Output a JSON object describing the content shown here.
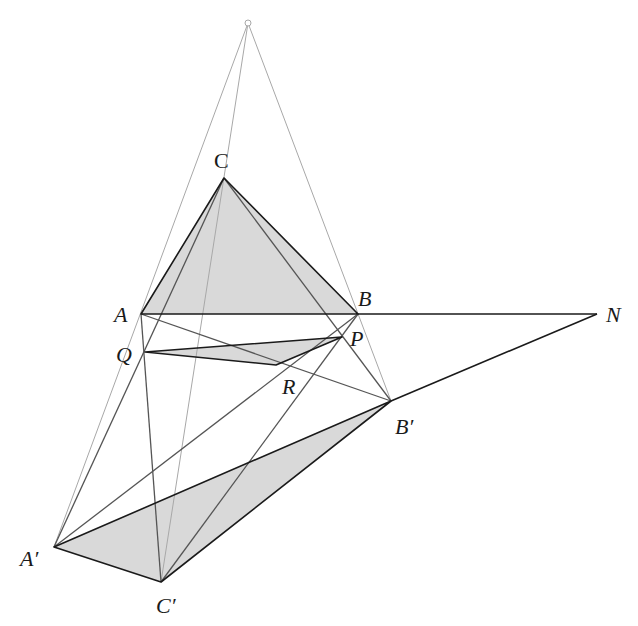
{
  "figure": {
    "fill_color": "#d9d9d9",
    "dark_stroke": "#1a1a1a",
    "medium_stroke": "#555555",
    "light_stroke": "#a8a8a8"
  },
  "points": {
    "O": {
      "x": 248,
      "y": 23,
      "label": ""
    },
    "A": {
      "x": 141,
      "y": 314,
      "label": "A"
    },
    "B": {
      "x": 358,
      "y": 314,
      "label": "B"
    },
    "C": {
      "x": 224,
      "y": 178,
      "label": "C"
    },
    "A1": {
      "x": 54,
      "y": 547,
      "label": "A′"
    },
    "B1": {
      "x": 391,
      "y": 401,
      "label": "B′"
    },
    "C1": {
      "x": 161,
      "y": 582,
      "label": "C′"
    },
    "P": {
      "x": 342,
      "y": 337,
      "label": "P"
    },
    "Q": {
      "x": 145,
      "y": 352,
      "label": "Q"
    },
    "R": {
      "x": 276,
      "y": 365,
      "label": "R"
    },
    "N": {
      "x": 597,
      "y": 314,
      "label": "N"
    }
  },
  "labels": {
    "A": {
      "text": "A",
      "x": 114,
      "y": 322
    },
    "B": {
      "text": "B",
      "x": 358,
      "y": 306
    },
    "C": {
      "text": "C",
      "x": 214,
      "y": 168,
      "upright": true
    },
    "A1": {
      "text": "A′",
      "x": 20,
      "y": 566
    },
    "B1": {
      "text": "B′",
      "x": 395,
      "y": 434
    },
    "C1": {
      "text": "C′",
      "x": 156,
      "y": 613
    },
    "P": {
      "text": "P",
      "x": 350,
      "y": 346
    },
    "Q": {
      "text": "Q",
      "x": 116,
      "y": 362
    },
    "R": {
      "text": "R",
      "x": 282,
      "y": 394
    },
    "N": {
      "text": "N",
      "x": 606,
      "y": 322
    }
  },
  "triangles": [
    {
      "name": "triangle-abc",
      "vertices": [
        "A",
        "B",
        "C"
      ]
    },
    {
      "name": "triangle-a1b1c1",
      "vertices": [
        "A1",
        "B1",
        "C1"
      ]
    },
    {
      "name": "triangle-pqr",
      "vertices": [
        "Q",
        "P",
        "R"
      ]
    }
  ],
  "segments": [
    {
      "name": "perspective-line-o-a1",
      "from": "O",
      "to": "A1",
      "style": "light"
    },
    {
      "name": "perspective-line-o-c1",
      "from": "O",
      "to": "C1",
      "style": "light"
    },
    {
      "name": "perspective-line-o-b1",
      "from": "O",
      "to": "B1",
      "style": "light"
    },
    {
      "name": "line-c-a1",
      "from": "C",
      "to": "A1",
      "style": "medium"
    },
    {
      "name": "line-c-b1",
      "from": "C",
      "to": "B1",
      "style": "medium"
    },
    {
      "name": "line-a-c1",
      "from": "A",
      "to": "C1",
      "style": "medium"
    },
    {
      "name": "line-a-b1",
      "from": "A",
      "to": "B1",
      "style": "medium"
    },
    {
      "name": "line-b-a1",
      "from": "B",
      "to": "A1",
      "style": "medium"
    },
    {
      "name": "line-b-c1",
      "from": "B",
      "to": "C1",
      "style": "medium"
    },
    {
      "name": "axis-line-b-n",
      "from": "B",
      "to": "N",
      "style": "dark"
    },
    {
      "name": "axis-line-b1-n",
      "from": "B1",
      "to": "N",
      "style": "dark"
    }
  ]
}
